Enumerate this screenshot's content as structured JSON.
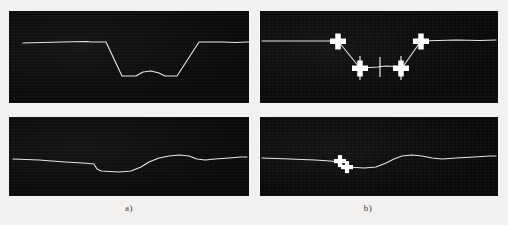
{
  "figure": {
    "background_color": "#f2f1ef",
    "panel_color": "#0a0a0a",
    "trace_color": "#e8e6df",
    "marker_color": "#ffffff",
    "caption_color": "#3a3a3a"
  },
  "captions": {
    "left": "a)",
    "right": "b)"
  },
  "panels": [
    {
      "id": "top-left",
      "name": "signal-panel-top-left",
      "x": 9,
      "y": 11,
      "width": 240,
      "height": 92,
      "has_markers": false,
      "trace": "M 14,32 L 52,31 L 78,30.5 L 82,31 L 97,31 L 113,65 L 127,65 L 134,61 L 142,60 L 150,62 L 156,65 L 168,65 L 190,31 L 215,31 L 226,31.5 L 238,31 L 240,31"
    },
    {
      "id": "top-right",
      "name": "signal-panel-top-right",
      "x": 260,
      "y": 11,
      "width": 238,
      "height": 92,
      "has_markers": true,
      "trace": "M 2,30 L 30,30 L 55,30 L 78,30 L 100,57 L 118,56 L 126,55 L 136,55.5 L 142,57 L 161,30 L 196,29 L 220,29.5 L 236,29",
      "markers": [
        {
          "name": "breakpoint-marker-1",
          "cx": 78,
          "cy": 30,
          "size": "large",
          "tick": false
        },
        {
          "name": "breakpoint-marker-2",
          "cx": 100,
          "cy": 57,
          "size": "large",
          "tick": true
        },
        {
          "name": "breakpoint-marker-3",
          "cx": 141,
          "cy": 57,
          "size": "large",
          "tick": true
        },
        {
          "name": "breakpoint-marker-4",
          "cx": 161,
          "cy": 30,
          "size": "large",
          "tick": false
        }
      ],
      "center_tick": {
        "name": "center-tick-mark",
        "x": 120,
        "y1": 46,
        "y2": 66
      }
    },
    {
      "id": "bottom-left",
      "name": "signal-panel-bottom-left",
      "x": 9,
      "y": 117,
      "width": 240,
      "height": 79,
      "has_markers": false,
      "trace": "M 4,42 L 30,43 L 56,45 L 74,46 L 85,47 L 88,52 L 92,54 L 110,55 L 122,54 L 132,50 L 140,45 L 150,41 L 160,39 L 170,38 L 180,39 L 188,42 L 196,43 L 206,42 L 220,41 L 232,40 L 238,40"
    },
    {
      "id": "bottom-right",
      "name": "signal-panel-bottom-right",
      "x": 260,
      "y": 117,
      "width": 238,
      "height": 79,
      "has_markers": true,
      "trace": "M 2,41 L 30,42 L 55,43 L 70,44 L 78,45 L 82,48 L 88,50 L 104,51 L 116,50 L 126,46 L 134,42 L 142,39 L 152,38 L 162,39 L 172,41 L 182,42 L 196,41 L 214,40 L 230,39 L 236,39",
      "markers": [
        {
          "name": "breakpoint-marker-1",
          "cx": 80,
          "cy": 44,
          "size": "small",
          "tick": false
        },
        {
          "name": "breakpoint-marker-2",
          "cx": 87,
          "cy": 50,
          "size": "small",
          "tick": false
        }
      ]
    }
  ]
}
